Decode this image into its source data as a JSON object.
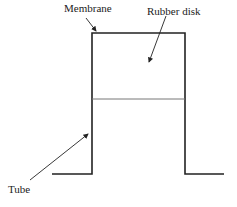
{
  "diagram": {
    "labels": {
      "membrane": "Membrane",
      "rubber_disk": "Rubber disk",
      "tube": "Tube"
    },
    "colors": {
      "line": "#222222",
      "divider": "#666666",
      "background": "#ffffff"
    }
  }
}
